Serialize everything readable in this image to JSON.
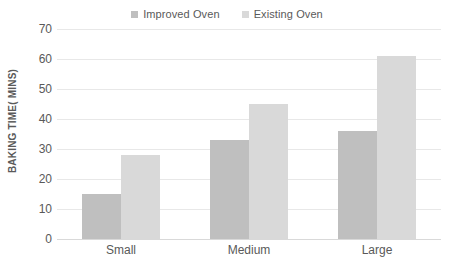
{
  "chart_data": {
    "type": "bar",
    "title": "",
    "subtitle": "",
    "xlabel": "",
    "ylabel": "BAKING TIME( MINS)",
    "categories": [
      "Small",
      "Medium",
      "Large"
    ],
    "series": [
      {
        "name": "Improved Oven",
        "color": "#bfbfbf",
        "values": [
          15,
          33,
          36
        ]
      },
      {
        "name": "Existing Oven",
        "color": "#d9d9d9",
        "values": [
          28,
          45,
          61
        ]
      }
    ],
    "ylim": [
      0,
      70
    ],
    "ytick_step": 10,
    "yticks": [
      0,
      10,
      20,
      30,
      40,
      50,
      60,
      70
    ],
    "ytick_labels": [
      "0",
      "10",
      "20",
      "30",
      "40",
      "50",
      "60",
      "70"
    ],
    "grid": true,
    "grid_axis": "y",
    "legend_position": "top-center",
    "background_color": "#ffffff",
    "grid_color": "#e8e8e8",
    "text_color": "#595959",
    "annotations": []
  },
  "legend": {
    "entries": [
      {
        "label": "Improved Oven",
        "marker": "square-swatch-icon"
      },
      {
        "label": "Existing Oven",
        "marker": "square-swatch-icon"
      }
    ]
  },
  "axes": {
    "y_title": "BAKING TIME( MINS)"
  }
}
